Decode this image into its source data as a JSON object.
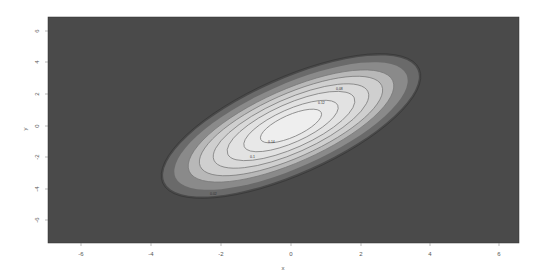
{
  "chart_data": {
    "type": "contour",
    "title": "",
    "xlabel": "x",
    "ylabel": "y",
    "xlim": [
      -7,
      6.5
    ],
    "ylim": [
      -7.5,
      7
    ],
    "x_ticks": [
      -6,
      -4,
      -2,
      0,
      2,
      4,
      6
    ],
    "y_ticks": [
      6,
      4,
      2,
      0,
      -2,
      -4,
      -6
    ],
    "x_tick_labels": [
      "-6",
      "-4",
      "-2",
      "0",
      "2",
      "4",
      "6"
    ],
    "y_tick_labels": [
      "6",
      "4",
      "2",
      "0",
      "-2",
      "-4",
      "-6"
    ],
    "grid": false,
    "legend": null,
    "center": [
      0,
      0
    ],
    "levels": [
      {
        "level": 1,
        "semi_major": 4.6,
        "semi_minor": 1.35,
        "fill": "#6a6a6a"
      },
      {
        "level": 2,
        "semi_major": 4.2,
        "semi_minor": 1.2,
        "fill": "#8a8a8a"
      },
      {
        "level": 3,
        "semi_major": 3.7,
        "semi_minor": 1.05,
        "fill": "#b8b8b8"
      },
      {
        "level": 4,
        "semi_major": 3.3,
        "semi_minor": 0.92,
        "fill": "#cfcfcf"
      },
      {
        "level": 5,
        "semi_major": 2.8,
        "semi_minor": 0.78,
        "fill": "#d9d9d9"
      },
      {
        "level": 6,
        "semi_major": 2.3,
        "semi_minor": 0.64,
        "fill": "#e2e2e2"
      },
      {
        "level": 7,
        "semi_major": 1.7,
        "semi_minor": 0.48,
        "fill": "#e8e8e8"
      },
      {
        "level": 8,
        "semi_major": 1.1,
        "semi_minor": 0.32,
        "fill": "#eeeeee"
      }
    ],
    "contour_labels": [
      "0.02",
      "0.04",
      "0.06",
      "0.08",
      "0.1",
      "0.12",
      "0.14"
    ],
    "background_fill": "#4a4a4a"
  }
}
